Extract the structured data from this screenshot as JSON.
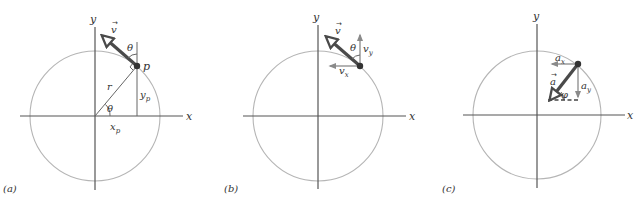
{
  "figure": {
    "panels": [
      {
        "id": "a",
        "caption": "(a)",
        "axis_x_label": "x",
        "axis_y_label": "y",
        "vector_label": "v",
        "vector_arrow_mark": "→",
        "point_label": "p",
        "radius_label": "r",
        "angle_at_origin_label": "θ",
        "angle_at_point_label": "θ",
        "xp_label": "x",
        "xp_sub": "p",
        "yp_label": "y",
        "yp_sub": "p"
      },
      {
        "id": "b",
        "caption": "(b)",
        "axis_x_label": "x",
        "axis_y_label": "y",
        "vector_label": "v",
        "vector_arrow_mark": "→",
        "angle_label": "θ",
        "vx_label": "v",
        "vx_sub": "x",
        "vy_label": "v",
        "vy_sub": "y"
      },
      {
        "id": "c",
        "caption": "(c)",
        "axis_x_label": "x",
        "axis_y_label": "y",
        "vector_label": "a",
        "vector_arrow_mark": "→",
        "angle_label": "φ",
        "ax_label": "a",
        "ax_sub": "x",
        "ay_label": "a",
        "ay_sub": "y"
      }
    ],
    "colors": {
      "axis": "#555555",
      "circle": "#b5b5b5",
      "vector": "#4a4a4a",
      "component": "#8a8a8a",
      "particle": "#333333"
    }
  }
}
